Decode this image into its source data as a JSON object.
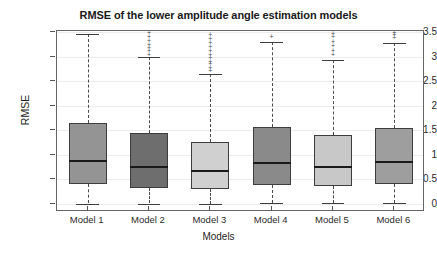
{
  "chart_data": {
    "type": "box",
    "title": "RMSE of the lower amplitude angle estimation models",
    "xlabel": "Models",
    "ylabel": "RMSE",
    "ylim": [
      0,
      3.5
    ],
    "ytick_labels": [
      "0",
      "0.5",
      "1",
      "1.5",
      "2",
      "2.5",
      "3",
      "3.5"
    ],
    "ytick_values": [
      0,
      0.5,
      1,
      1.5,
      2,
      2.5,
      3,
      3.5
    ],
    "categories": [
      "Model 1",
      "Model 2",
      "Model 3",
      "Model 4",
      "Model 5",
      "Model 6"
    ],
    "grid": true,
    "legend": "none",
    "boxes": [
      {
        "label": "Model 1",
        "whisker_low": 0.01,
        "q1": 0.4,
        "median": 0.88,
        "q3": 1.65,
        "whisker_high": 3.45,
        "fill": "#949494",
        "outliers": []
      },
      {
        "label": "Model 2",
        "whisker_low": 0.01,
        "q1": 0.32,
        "median": 0.76,
        "q3": 1.44,
        "whisker_high": 2.99,
        "fill": "#6e6e6e",
        "outliers": [
          3.06,
          3.13,
          3.19,
          3.26,
          3.33,
          3.42,
          3.49
        ]
      },
      {
        "label": "Model 3",
        "whisker_low": 0.01,
        "q1": 0.3,
        "median": 0.68,
        "q3": 1.26,
        "whisker_high": 2.65,
        "fill": "#d0d0d0",
        "outliers": [
          2.72,
          2.79,
          2.86,
          2.92,
          2.99,
          3.06,
          3.14,
          3.22,
          3.3,
          3.38,
          3.46
        ]
      },
      {
        "label": "Model 4",
        "whisker_low": 0.02,
        "q1": 0.38,
        "median": 0.83,
        "q3": 1.57,
        "whisker_high": 3.3,
        "fill": "#8a8a8a",
        "outliers": [
          3.42
        ]
      },
      {
        "label": "Model 5",
        "whisker_low": 0.02,
        "q1": 0.37,
        "median": 0.76,
        "q3": 1.41,
        "whisker_high": 2.94,
        "fill": "#c8c8c8",
        "outliers": [
          3.05,
          3.14,
          3.23,
          3.32,
          3.41,
          3.48
        ]
      },
      {
        "label": "Model 6",
        "whisker_low": 0.02,
        "q1": 0.4,
        "median": 0.86,
        "q3": 1.55,
        "whisker_high": 3.28,
        "fill": "#9e9e9e",
        "outliers": [
          3.4,
          3.46,
          3.5
        ]
      }
    ]
  },
  "colors": {
    "axis": "#666666",
    "grid": "#ececec",
    "text": "#1f1f1f",
    "median": "#1a1a1a",
    "whisker": "#4a4a4a"
  }
}
